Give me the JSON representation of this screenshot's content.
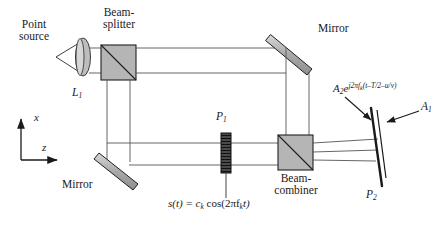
{
  "figure": {
    "kind": "optical-interferometer-diagram"
  },
  "labels": {
    "point_source_line1": "Point",
    "point_source_line2": "source",
    "lens": "L",
    "lens_sub": "1",
    "beamsplitter_line1": "Beam-",
    "beamsplitter_line2": "splitter",
    "mirror_top": "Mirror",
    "mirror_bottom": "Mirror",
    "cell": "P",
    "cell_sub": "1",
    "combiner_line1": "Beam-",
    "combiner_line2": "combiner",
    "plate": "P",
    "plate_sub": "2",
    "aperture": "A",
    "aperture_sub": "1",
    "axis_x": "x",
    "axis_z": "z"
  },
  "equations": {
    "drive_signal": {
      "lhs": "s(t) = c",
      "lhs_sub": "k",
      "mid": " cos(2πf",
      "mid_sub": "k",
      "rhs": "t)"
    },
    "field": {
      "amp": "A",
      "amp_sub": "2",
      "exp_base": "e",
      "exp_text": "j2πf",
      "exp_sub": "k",
      "exp_tail": "(t–T/2–u/v)"
    }
  },
  "colors": {
    "ink": "#1a1a1a",
    "beam_line": "#555555",
    "optic_fill": "#b8b8b8",
    "optic_stroke": "#2a2a2a",
    "cell_fill": "#3a3a3a",
    "background": "#ffffff"
  }
}
